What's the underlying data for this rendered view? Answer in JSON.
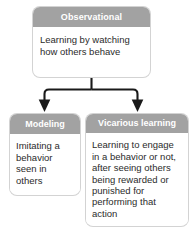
{
  "diagram": {
    "background_color": "#ffffff",
    "header_color": "#a2a2a2",
    "header_text_color": "#ffffff",
    "body_color": "#ffffff",
    "body_text_color": "#2b2b2b",
    "border_color": "#d3d3d3",
    "connector_color": "#1a1a1a",
    "nodes": [
      {
        "id": "observational",
        "header": "Observational",
        "body": "Learning by watching how others behave"
      },
      {
        "id": "modeling",
        "header": "Modeling",
        "body": "Imitating a behavior seen in others"
      },
      {
        "id": "vicarious",
        "header": "Vicarious learning",
        "body": "Learning to engage in a behavior or not, after seeing others being rewarded or punished for performing that action"
      }
    ],
    "connectors": [
      {
        "id": "observational-to-modeling",
        "from": "observational",
        "to": "modeling",
        "style": "elbow-arrow"
      },
      {
        "id": "observational-to-vicarious",
        "from": "observational",
        "to": "vicarious",
        "style": "elbow-arrow"
      }
    ]
  }
}
